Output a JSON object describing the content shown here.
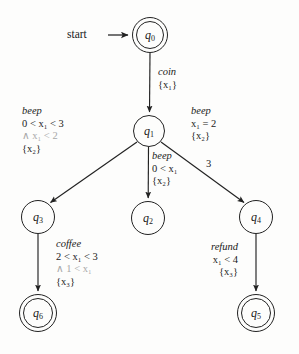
{
  "figure": {
    "start_label": "start",
    "background": "#fdfdfc",
    "ink": "#1a1a1a",
    "faded_ink": "#a8a8a8"
  },
  "states": [
    {
      "id": "q0",
      "name": "q",
      "index": "0",
      "accepting": true,
      "cx": 150,
      "cy": 35,
      "r": 18
    },
    {
      "id": "q1",
      "name": "q",
      "index": "1",
      "accepting": false,
      "cx": 149,
      "cy": 131,
      "r": 16
    },
    {
      "id": "q2",
      "name": "q",
      "index": "2",
      "accepting": false,
      "cx": 148,
      "cy": 218,
      "r": 17
    },
    {
      "id": "q3",
      "name": "q",
      "index": "3",
      "accepting": false,
      "cx": 38,
      "cy": 217,
      "r": 17
    },
    {
      "id": "q4",
      "name": "q",
      "index": "4",
      "accepting": false,
      "cx": 256,
      "cy": 217,
      "r": 17
    },
    {
      "id": "q5",
      "name": "q",
      "index": "5",
      "accepting": true,
      "cx": 256,
      "cy": 313,
      "r": 19
    },
    {
      "id": "q6",
      "name": "q",
      "index": "6",
      "accepting": true,
      "cx": 38,
      "cy": 313,
      "r": 19
    }
  ],
  "edges": [
    {
      "id": "start-to-q0",
      "from": "start",
      "to": "q0",
      "action": "",
      "guard": "",
      "guard_extra": "",
      "reset": ""
    },
    {
      "id": "q0-to-q1",
      "from": "q0",
      "to": "q1",
      "action": "coin",
      "guard": "",
      "guard_extra": "",
      "reset": "{x₁}"
    },
    {
      "id": "q1-to-q3",
      "from": "q1",
      "to": "q3",
      "action": "beep",
      "guard": "0 < x₁ < 3",
      "guard_extra": "∧ x₁ < 2",
      "reset": "{x₂}"
    },
    {
      "id": "q1-to-q2",
      "from": "q1",
      "to": "q2",
      "action": "beep",
      "guard": "0 < x₁",
      "guard_extra": "",
      "reset": "{x₂}"
    },
    {
      "id": "q1-to-q4",
      "from": "q1",
      "to": "q4",
      "action": "beep",
      "guard": "x₁ = 2",
      "guard_extra": "",
      "reset": "{x₂}",
      "inline_mark": "3"
    },
    {
      "id": "q3-to-q6",
      "from": "q3",
      "to": "q6",
      "action": "coffee",
      "guard": "2 < x₁ < 3",
      "guard_extra": "∧ 1 < x₁",
      "reset": "{x₃}"
    },
    {
      "id": "q4-to-q5",
      "from": "q4",
      "to": "q5",
      "action": "refund",
      "guard": "x₁ < 4",
      "guard_extra": "",
      "reset": "{x₃}"
    }
  ],
  "labels": {
    "coin_action": "coin",
    "coin_reset": "{x₁}",
    "left_action": "beep",
    "left_guard": "0 < x₁ < 3",
    "left_guard_extra": "∧ x₁ < 2",
    "left_reset": "{x₂}",
    "mid_action": "beep",
    "mid_guard": "0 < x₁",
    "mid_reset": "{x₂}",
    "right_action": "beep",
    "right_guard": "x₁ = 2",
    "right_reset": "{x₂}",
    "three_mark": "3",
    "coffee_action": "coffee",
    "coffee_guard": "2 < x₁ < 3",
    "coffee_guard_extra": "∧ 1 < x₁",
    "coffee_reset": "{x₃}",
    "refund_action": "refund",
    "refund_guard": "x₁ < 4",
    "refund_reset": "{x₃}"
  },
  "node_names": {
    "q0": "q0",
    "q1": "q1",
    "q2": "q2",
    "q3": "q3",
    "q4": "q4",
    "q5": "q5",
    "q6": "q6"
  }
}
